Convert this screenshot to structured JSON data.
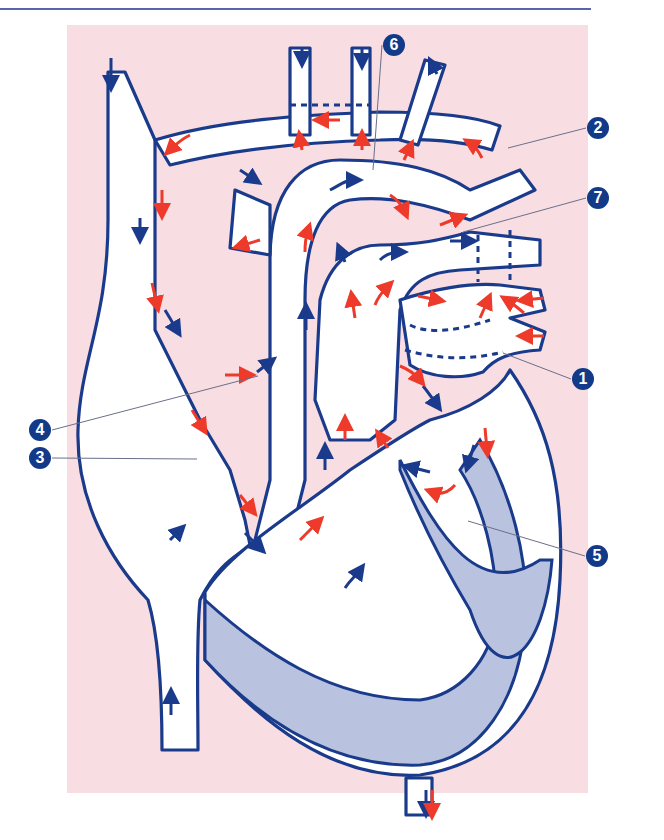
{
  "figure": {
    "type": "anatomical-diagram",
    "colors": {
      "background": "#ffffff",
      "panel": "#f8dde2",
      "outline": "#1a3a8c",
      "vessel_fill": "#ffffff",
      "myocardium": "#b9c3df",
      "oxygenated_arrow": "#ee3a2a",
      "deoxygenated_arrow": "#1a3a8c",
      "callout_badge": "#123a88",
      "leader_line": "#6a6f8a",
      "top_rule": "#5a64a8"
    },
    "callouts": [
      {
        "number": "1",
        "x": 583,
        "y": 379,
        "target_x": 503,
        "target_y": 353
      },
      {
        "number": "2",
        "x": 598,
        "y": 128,
        "target_x": 508,
        "target_y": 148
      },
      {
        "number": "3",
        "x": 40,
        "y": 458,
        "target_x": 197,
        "target_y": 459
      },
      {
        "number": "4",
        "x": 40,
        "y": 430,
        "target_x": 258,
        "target_y": 376
      },
      {
        "number": "5",
        "x": 597,
        "y": 556,
        "target_x": 468,
        "target_y": 521
      },
      {
        "number": "6",
        "x": 394,
        "y": 45,
        "target_x": 373,
        "target_y": 170
      },
      {
        "number": "7",
        "x": 598,
        "y": 198,
        "target_x": 463,
        "target_y": 232
      }
    ],
    "legend": {
      "red_arrow": "oxygenated blood flow",
      "blue_arrow": "deoxygenated blood flow"
    }
  }
}
